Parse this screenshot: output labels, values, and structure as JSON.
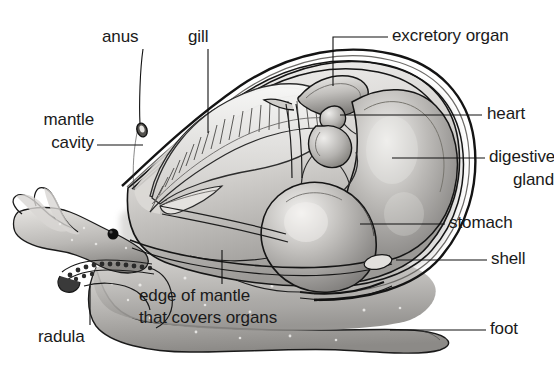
{
  "diagram": {
    "type": "labelled biological cross-section",
    "style": "grayscale pencil shaded illustration",
    "background_color": "#ffffff",
    "ink_color": "#111111",
    "text_color": "#1a1a1a"
  },
  "labels": {
    "anus": "anus",
    "gill": "gill",
    "mantle_line1": "mantle",
    "mantle_line2": "cavity",
    "excretory_organ": "excretory organ",
    "heart": "heart",
    "digestive_line1": "digestive",
    "digestive_line2": "gland",
    "stomach": "stomach",
    "shell": "shell",
    "foot": "foot",
    "radula": "radula",
    "edge_line1": "edge of mantle",
    "edge_line2": "that covers organs"
  },
  "palette": {
    "shell_light": "#f0efed",
    "shell_mid": "#c9c7c4",
    "shell_dark": "#8d8b88",
    "organ_light": "#e6e4e2",
    "organ_mid": "#a9a7a4",
    "organ_dark": "#6f6d6b",
    "foot_light": "#cfcdca",
    "foot_mid": "#a3a1a0",
    "outline": "#151515",
    "eye": "#101010"
  }
}
